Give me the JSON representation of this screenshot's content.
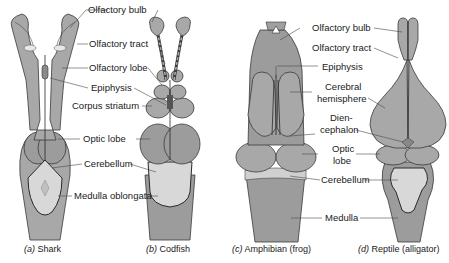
{
  "figure": {
    "panels": [
      {
        "id": "a",
        "caption_letter": "a",
        "caption_name": "Shark",
        "labels": [
          "Olfactory bulb",
          "Olfactory tract",
          "Olfactory lobe",
          "Epiphysis",
          "Corpus striatum",
          "Optic lobe",
          "Cerebellum",
          "Medulla oblongata"
        ]
      },
      {
        "id": "b",
        "caption_letter": "b",
        "caption_name": "Codfish"
      },
      {
        "id": "c",
        "caption_letter": "c",
        "caption_name": "Amphibian (frog)",
        "labels": [
          "Olfactory bulb",
          "Olfactory tract",
          "Epiphysis",
          "Cerebral hemisphere",
          "Dien- cephalon",
          "Optic lobe",
          "Cerebellum",
          "Medulla"
        ]
      },
      {
        "id": "d",
        "caption_letter": "d",
        "caption_name": "Reptile (alligator)"
      }
    ],
    "left_labels": {
      "olfactory_bulb": "Olfactory bulb",
      "olfactory_tract": "Olfactory tract",
      "olfactory_lobe": "Olfactory lobe",
      "epiphysis": "Epiphysis",
      "corpus_striatum": "Corpus striatum",
      "optic_lobe": "Optic lobe",
      "cerebellum": "Cerebellum",
      "medulla_oblongata": "Medulla oblongata"
    },
    "right_labels": {
      "olfactory_bulb": "Olfactory bulb",
      "olfactory_tract": "Olfactory tract",
      "epiphysis": "Epiphysis",
      "cerebral_1": "Cerebral",
      "cerebral_2": "hemisphere",
      "dien_1": "Dien-",
      "dien_2": "cephalon",
      "optic_1": "Optic",
      "optic_2": "lobe",
      "cerebellum": "Cerebellum",
      "medulla": "Medulla"
    },
    "captions": {
      "a_letter": "(a)",
      "a_name": " Shark",
      "b_letter": "(b)",
      "b_name": " Codfish",
      "c_letter": "(c)",
      "c_name": " Amphibian (frog)",
      "d_letter": "(d)",
      "d_name": " Reptile (alligator)"
    },
    "colors": {
      "tissue": "#a9a9a9",
      "tissue_dark": "#9a9a9a",
      "cerebellum_light": "#d6d6d6",
      "outline": "#3a3a3a",
      "text": "#1a1a1a"
    }
  }
}
